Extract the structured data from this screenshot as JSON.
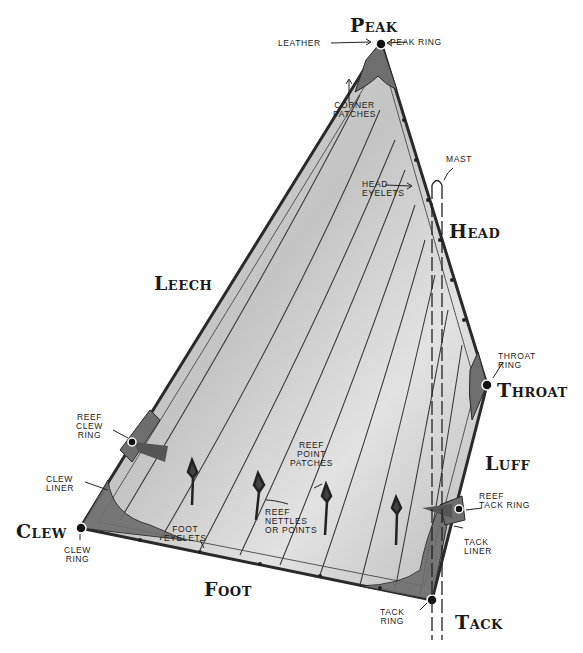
{
  "diagram": {
    "colors": {
      "sail_fill": "#c9c9c9",
      "sail_fill_light": "#e4e4e4",
      "patch_fill": "#777777",
      "outline": "#2a2a2a",
      "ink": "#1a1a1a",
      "background": "#ffffff"
    },
    "edge_labels": {
      "peak": "Peak",
      "head": "Head",
      "leech": "Leech",
      "throat": "Throat",
      "luff": "Luff",
      "clew": "Clew",
      "foot": "Foot",
      "tack": "Tack"
    },
    "part_labels": {
      "leather": "Leather",
      "peak_ring": "Peak ring",
      "corner_patches": "Corner\npatches",
      "mast": "Mast",
      "head_eyelets": "Head\neyelets",
      "throat_ring": "Throat\nring",
      "reef_clew_ring": "Reef\nclew\nring",
      "clew_liner": "Clew\nliner",
      "clew_ring": "Clew\nring",
      "foot_eyelets": "Foot\neyelets",
      "reef_point_patches": "Reef\npoint\npatches",
      "reef_nettles": "Reef\nnettles\nor points",
      "reef_tack_ring": "Reef\ntack ring",
      "tack_liner": "Tack\nliner",
      "tack_ring": "Tack\nring"
    }
  }
}
